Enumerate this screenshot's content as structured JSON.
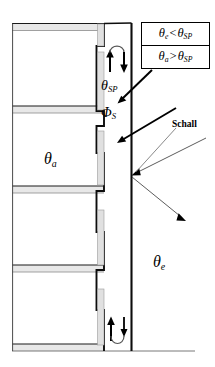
{
  "figure": {
    "type": "technical-cross-section",
    "background_color": "#ffffff",
    "line_color": "#000000",
    "slab_fill_color": "#e8e8e8",
    "panel_fill_color": "#e0e0e0"
  },
  "legend": {
    "box_border_color": "#000000",
    "rows": [
      {
        "id": "condition-exterior-cooler",
        "left_symbol": "θ",
        "left_subscript": "e",
        "operator": "<",
        "right_symbol": "θ",
        "right_subscript": "SP",
        "text": "θe < θSP"
      },
      {
        "id": "condition-interior-warmer",
        "left_symbol": "θ",
        "left_subscript": "a",
        "operator": ">",
        "right_symbol": "θ",
        "right_subscript": "SP",
        "text": "θa > θSP"
      }
    ]
  },
  "labels": {
    "theta_sp": {
      "symbol": "θ",
      "subscript": "SP",
      "text": "θSP",
      "meaning": "cavity-temperature"
    },
    "phi_s": {
      "symbol": "Φ",
      "subscript": "S",
      "text": "ΦS",
      "meaning": "solar-heat-flux"
    },
    "theta_a": {
      "symbol": "θ",
      "subscript": "a",
      "text": "θa",
      "meaning": "indoor-temperature"
    },
    "theta_e": {
      "symbol": "θ",
      "subscript": "e",
      "text": "θe",
      "meaning": "outdoor-temperature"
    },
    "schall": {
      "text": "Schall",
      "meaning": "sound"
    }
  },
  "airflow": {
    "top": {
      "name": "top-air-exchange",
      "up_arrow": true,
      "down_arrow": true,
      "arc": "over"
    },
    "bottom": {
      "name": "bottom-air-exchange",
      "up_arrow": true,
      "down_arrow": true,
      "arc": "under"
    }
  },
  "leaders": {
    "legend_to_cavity": [
      {
        "name": "leader-theta-e-condition"
      },
      {
        "name": "leader-theta-a-condition"
      }
    ]
  },
  "sound_rays": {
    "incident": {
      "name": "incident-sound-ray",
      "direction": "down-left-to-facade"
    },
    "reflected": {
      "name": "reflected-sound-ray",
      "direction": "down-right-from-facade"
    },
    "pointer": {
      "name": "schall-pointer-line"
    }
  },
  "geometry": {
    "storeys": 4,
    "slab_count": 5,
    "facade_panel_count": 5
  }
}
